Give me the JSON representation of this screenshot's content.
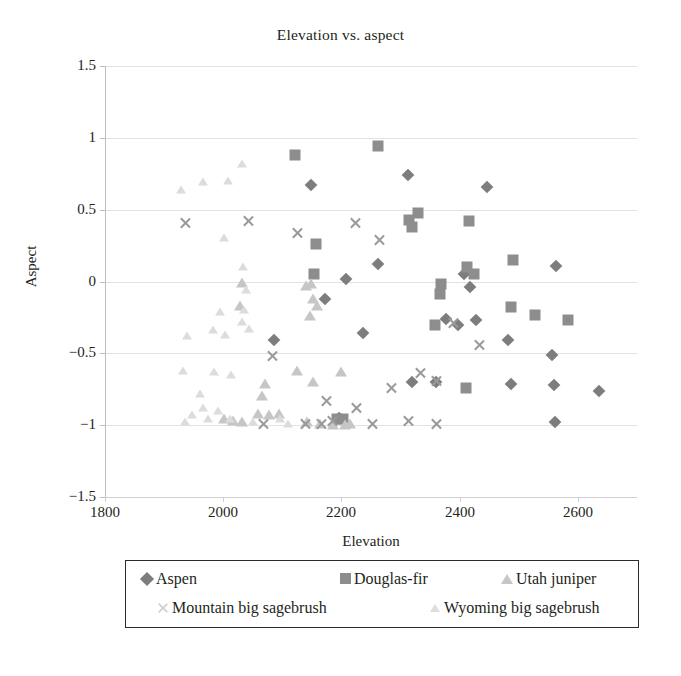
{
  "chart_data": {
    "type": "scatter",
    "title": "Elevation vs. aspect",
    "xlabel": "Elevation",
    "ylabel": "Aspect",
    "xlim": [
      1800,
      2700
    ],
    "ylim": [
      -1.5,
      1.5
    ],
    "xticks": [
      "1800",
      "2000",
      "2200",
      "2400",
      "2600"
    ],
    "xtick_values": [
      1800,
      2000,
      2200,
      2400,
      2600
    ],
    "yticks": [
      "1.5",
      "1",
      "0.5",
      "0",
      "-0.5",
      "-1",
      "-1.5"
    ],
    "ytick_values": [
      1.5,
      1,
      0.5,
      0,
      -0.5,
      -1,
      -1.5
    ],
    "grid": "horizontal",
    "legend_position": "bottom",
    "series": [
      {
        "name": "Aspen",
        "marker": "diamond",
        "color": "#7d7d7d",
        "points": [
          [
            2148,
            0.67
          ],
          [
            2312,
            0.74
          ],
          [
            2447,
            0.66
          ],
          [
            2262,
            0.12
          ],
          [
            2207,
            0.02
          ],
          [
            2172,
            -0.12
          ],
          [
            2086,
            -0.41
          ],
          [
            2237,
            -0.36
          ],
          [
            2408,
            0.05
          ],
          [
            2417,
            -0.04
          ],
          [
            2397,
            -0.3
          ],
          [
            2427,
            -0.27
          ],
          [
            2563,
            0.11
          ],
          [
            2320,
            -0.7
          ],
          [
            2360,
            -0.7
          ],
          [
            2482,
            -0.41
          ],
          [
            2556,
            -0.51
          ],
          [
            2487,
            -0.71
          ],
          [
            2560,
            -0.72
          ],
          [
            2636,
            -0.76
          ],
          [
            2196,
            -0.95
          ],
          [
            2561,
            -0.98
          ],
          [
            2377,
            -0.26
          ]
        ]
      },
      {
        "name": "Douglas-fir",
        "marker": "square",
        "color": "#8d8d8d",
        "points": [
          [
            2121,
            0.88
          ],
          [
            2261,
            0.94
          ],
          [
            2315,
            0.43
          ],
          [
            2330,
            0.48
          ],
          [
            2320,
            0.38
          ],
          [
            2415,
            0.42
          ],
          [
            2157,
            0.26
          ],
          [
            2153,
            0.05
          ],
          [
            2413,
            0.1
          ],
          [
            2425,
            0.05
          ],
          [
            2491,
            0.15
          ],
          [
            2369,
            -0.02
          ],
          [
            2366,
            -0.09
          ],
          [
            2487,
            -0.18
          ],
          [
            2527,
            -0.23
          ],
          [
            2583,
            -0.27
          ],
          [
            2358,
            -0.3
          ],
          [
            2411,
            -0.74
          ],
          [
            2192,
            -0.96
          ],
          [
            2203,
            -0.96
          ]
        ]
      },
      {
        "name": "Utah juniper",
        "marker": "triangle",
        "color": "#c6c6c6",
        "points": [
          [
            2032,
            -0.01
          ],
          [
            2028,
            -0.17
          ],
          [
            2140,
            -0.03
          ],
          [
            2148,
            -0.02
          ],
          [
            2152,
            -0.12
          ],
          [
            2146,
            -0.24
          ],
          [
            2159,
            -0.17
          ],
          [
            2124,
            -0.62
          ],
          [
            2200,
            -0.63
          ],
          [
            2152,
            -0.7
          ],
          [
            2070,
            -0.71
          ],
          [
            2065,
            -0.8
          ],
          [
            2058,
            -0.92
          ],
          [
            2077,
            -0.93
          ],
          [
            2094,
            -0.92
          ],
          [
            2142,
            -0.98
          ],
          [
            2164,
            -0.99
          ],
          [
            2186,
            -1.0
          ],
          [
            2206,
            -1.0
          ],
          [
            2215,
            -0.99
          ],
          [
            2002,
            -0.96
          ],
          [
            2016,
            -0.97
          ],
          [
            2031,
            -0.98
          ]
        ]
      },
      {
        "name": "Mountain big sagebrush",
        "marker": "x",
        "color": "#9a9a9a",
        "points": [
          [
            1936,
            0.41
          ],
          [
            2125,
            0.34
          ],
          [
            2042,
            0.42
          ],
          [
            2223,
            0.41
          ],
          [
            2264,
            0.29
          ],
          [
            2083,
            -0.52
          ],
          [
            2390,
            -0.29
          ],
          [
            2434,
            -0.44
          ],
          [
            2334,
            -0.64
          ],
          [
            2284,
            -0.74
          ],
          [
            2361,
            -0.69
          ],
          [
            2174,
            -0.83
          ],
          [
            2226,
            -0.88
          ],
          [
            2360,
            -0.99
          ],
          [
            2166,
            -0.99
          ],
          [
            2185,
            -0.97
          ],
          [
            2253,
            -0.99
          ],
          [
            2068,
            -0.99
          ],
          [
            2313,
            -0.97
          ],
          [
            2139,
            -0.99
          ]
        ]
      },
      {
        "name": "Wyoming big sagebrush",
        "marker": "triangle-small",
        "color": "#dcdcdc",
        "points": [
          [
            1928,
            0.64
          ],
          [
            1966,
            0.69
          ],
          [
            2008,
            0.7
          ],
          [
            2032,
            0.82
          ],
          [
            2001,
            0.3
          ],
          [
            2033,
            0.1
          ],
          [
            2039,
            -0.06
          ],
          [
            2035,
            -0.2
          ],
          [
            1995,
            -0.21
          ],
          [
            2032,
            -0.28
          ],
          [
            1983,
            -0.34
          ],
          [
            2003,
            -0.37
          ],
          [
            2043,
            -0.33
          ],
          [
            1938,
            -0.38
          ],
          [
            1932,
            -0.62
          ],
          [
            1985,
            -0.63
          ],
          [
            2013,
            -0.65
          ],
          [
            1960,
            -0.78
          ],
          [
            1966,
            -0.88
          ],
          [
            1992,
            -0.9
          ],
          [
            1948,
            -0.93
          ],
          [
            1975,
            -0.96
          ],
          [
            2011,
            -0.96
          ],
          [
            2051,
            -0.98
          ],
          [
            2109,
            -0.99
          ],
          [
            1936,
            -0.98
          ],
          [
            2096,
            -0.96
          ]
        ]
      }
    ]
  },
  "legend": {
    "rows": [
      [
        {
          "label": "Aspen",
          "swatch": "sw-diamond",
          "icon": "diamond-marker-icon"
        },
        {
          "label": "Douglas-fir",
          "swatch": "sw-square",
          "icon": "square-marker-icon"
        },
        {
          "label": "Utah juniper",
          "swatch": "sw-triangle",
          "icon": "triangle-marker-icon"
        }
      ],
      [
        {
          "label": "Mountain big sagebrush",
          "swatch": "sw-x",
          "icon": "x-marker-icon"
        },
        {
          "label": "Wyoming big sagebrush",
          "swatch": "sw-triangle-pale",
          "icon": "small-triangle-marker-icon"
        }
      ]
    ]
  }
}
